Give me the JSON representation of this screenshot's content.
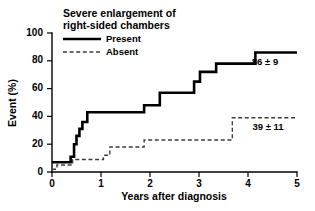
{
  "chart_data": {
    "type": "line",
    "subtype": "step-kaplan-meier",
    "title": "",
    "xlabel": "Years after diagnosis",
    "ylabel": "Event (%)",
    "xlim": [
      0,
      5
    ],
    "ylim": [
      0,
      100
    ],
    "xticks": [
      "0",
      "1",
      "2",
      "3",
      "4",
      "5"
    ],
    "yticks": [
      "0",
      "20",
      "40",
      "60",
      "80",
      "100"
    ],
    "grid": false,
    "legend_position": "top-left-inside",
    "legend_title": "Severe enlargement of right-sided chambers",
    "legend_title_line1": "Severe enlargement of",
    "legend_title_line2": "right-sided chambers",
    "series": [
      {
        "name": "Present",
        "style": "solid",
        "color": "#000000",
        "final_label": "86 ± 9",
        "final_value": 86,
        "final_sd": 9,
        "steps": [
          [
            0.0,
            7
          ],
          [
            0.38,
            7
          ],
          [
            0.38,
            11
          ],
          [
            0.45,
            11
          ],
          [
            0.45,
            20
          ],
          [
            0.5,
            20
          ],
          [
            0.5,
            26
          ],
          [
            0.56,
            26
          ],
          [
            0.56,
            31
          ],
          [
            0.62,
            31
          ],
          [
            0.62,
            36
          ],
          [
            0.72,
            36
          ],
          [
            0.72,
            43
          ],
          [
            1.88,
            43
          ],
          [
            1.88,
            48
          ],
          [
            2.2,
            48
          ],
          [
            2.2,
            57
          ],
          [
            2.9,
            57
          ],
          [
            2.9,
            65
          ],
          [
            3.02,
            65
          ],
          [
            3.02,
            72
          ],
          [
            3.35,
            72
          ],
          [
            3.35,
            78
          ],
          [
            4.15,
            78
          ],
          [
            4.15,
            86
          ],
          [
            5.0,
            86
          ]
        ]
      },
      {
        "name": "Absent",
        "style": "dashed",
        "color": "#3d3d3d",
        "final_label": "39 ± 11",
        "final_value": 39,
        "final_sd": 11,
        "steps": [
          [
            0.0,
            2
          ],
          [
            0.1,
            2
          ],
          [
            0.1,
            5
          ],
          [
            0.42,
            5
          ],
          [
            0.42,
            9
          ],
          [
            1.05,
            9
          ],
          [
            1.05,
            12
          ],
          [
            1.18,
            12
          ],
          [
            1.18,
            18
          ],
          [
            1.88,
            18
          ],
          [
            1.88,
            23
          ],
          [
            3.68,
            23
          ],
          [
            3.68,
            39
          ],
          [
            5.0,
            39
          ]
        ]
      }
    ],
    "annotations": [
      {
        "text": "86 ± 9",
        "x": 4.35,
        "y": 80,
        "series": "Present"
      },
      {
        "text": "39 ± 11",
        "x": 4.3,
        "y": 33,
        "series": "Absent"
      }
    ]
  },
  "legend": {
    "title_line1": "Severe enlargement of",
    "title_line2": "right-sided chambers",
    "entries": [
      {
        "label": "Present",
        "style": "solid"
      },
      {
        "label": "Absent",
        "style": "dashed"
      }
    ]
  },
  "axes": {
    "y_title": "Event (%)",
    "x_title": "Years after diagnosis",
    "y_tick_labels": [
      "100",
      "80",
      "60",
      "40",
      "20",
      "0"
    ],
    "x_tick_labels": [
      "0",
      "1",
      "2",
      "3",
      "4",
      "5"
    ]
  },
  "colors": {
    "present_line": "#000000",
    "absent_line": "#3d3d3d",
    "axis": "#000000",
    "background": "#ffffff"
  }
}
